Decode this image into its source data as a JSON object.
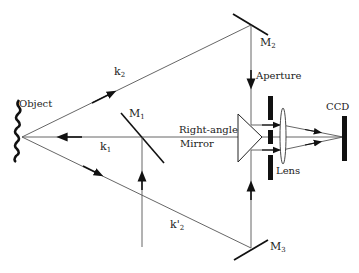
{
  "diagram": {
    "type": "optical-setup",
    "labels": {
      "object": "Object",
      "k2": "k",
      "k2_sub": "2",
      "k1": "k",
      "k1_sub": "1",
      "k2prime": "k'",
      "k2prime_sub": "2",
      "m1": "M",
      "m1_sub": "1",
      "m2": "M",
      "m2_sub": "2",
      "m3": "M",
      "m3_sub": "3",
      "aperture": "Aperture",
      "right_angle": "Right-angle",
      "mirror": "Mirror",
      "lens": "Lens",
      "ccd": "CCD"
    },
    "components": [
      {
        "id": "object",
        "label": "Object"
      },
      {
        "id": "M1",
        "label": "M1",
        "kind": "mirror"
      },
      {
        "id": "M2",
        "label": "M2",
        "kind": "mirror"
      },
      {
        "id": "M3",
        "label": "M3",
        "kind": "mirror"
      },
      {
        "id": "prism",
        "label": "Right-angle Mirror"
      },
      {
        "id": "aperture",
        "label": "Aperture"
      },
      {
        "id": "lens",
        "label": "Lens"
      },
      {
        "id": "ccd",
        "label": "CCD"
      }
    ],
    "beams": [
      {
        "id": "k1",
        "from": "M1",
        "to": "object"
      },
      {
        "id": "k2",
        "from": "object",
        "to": "M2"
      },
      {
        "id": "k2prime",
        "from": "object",
        "to": "M3"
      }
    ],
    "colors": {
      "line": "#555555",
      "component": "#111111"
    }
  }
}
